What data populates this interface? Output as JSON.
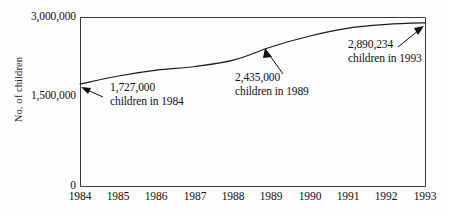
{
  "chart_data": {
    "type": "line",
    "title": "",
    "xlabel": "",
    "ylabel": "No. of children",
    "x": [
      1984,
      1985,
      1986,
      1987,
      1988,
      1989,
      1990,
      1991,
      1992,
      1993
    ],
    "xticklabels": [
      "1984",
      "1985",
      "1986",
      "1987",
      "1988",
      "1989",
      "1990",
      "1991",
      "1992",
      "1993"
    ],
    "values": [
      1727000,
      1880000,
      1990000,
      2060000,
      2180000,
      2435000,
      2640000,
      2790000,
      2860000,
      2890234
    ],
    "yticks": [
      0,
      1500000,
      3000000
    ],
    "yticklabels": [
      "0",
      "1,500,000",
      "3,000,000"
    ],
    "ylim": [
      0,
      3000000
    ],
    "xlim": [
      1984,
      1993
    ],
    "grid": false,
    "legend": null,
    "annotations": [
      {
        "id": "annot-1984",
        "value": 1727000,
        "year": 1984,
        "line1": "1,727,000",
        "line2": "children in 1984"
      },
      {
        "id": "annot-1989",
        "value": 2435000,
        "year": 1989,
        "line1": "2,435,000",
        "line2": "children in 1989"
      },
      {
        "id": "annot-1993",
        "value": 2890234,
        "year": 1993,
        "line1": "2,890,234",
        "line2": "children in 1993"
      }
    ],
    "colors": {
      "line": "#1a1a1a",
      "axis": "#3a3a3a",
      "text": "#111111",
      "background": "#fdfdfd"
    }
  }
}
